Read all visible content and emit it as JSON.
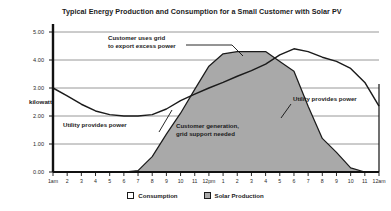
{
  "chart_data": {
    "type": "area",
    "title": "Typical Energy Production and Consumption for a Small Customer with Solar PV",
    "xlabel": "",
    "ylabel": "kilowatt",
    "ylim": [
      0.0,
      5.0
    ],
    "grid": true,
    "legend_position": "bottom",
    "x": [
      "1am",
      "2",
      "3",
      "4",
      "5",
      "6",
      "7",
      "8",
      "9",
      "10",
      "11",
      "12pm",
      "1",
      "2",
      "3",
      "4",
      "5",
      "6",
      "7",
      "8",
      "9",
      "10",
      "11",
      "12am"
    ],
    "yticks": [
      "0.00",
      "1.00",
      "2.00",
      "3.00",
      "4.00",
      "5.00"
    ],
    "ytick_values": [
      0.0,
      1.0,
      2.0,
      3.0,
      4.0,
      5.0
    ],
    "series": [
      {
        "name": "Consumption",
        "color": "#ffffff",
        "line_color": "#1b1b1b",
        "values": [
          3.0,
          2.72,
          2.42,
          2.18,
          2.05,
          2.0,
          2.0,
          2.05,
          2.25,
          2.55,
          2.78,
          3.0,
          3.2,
          3.42,
          3.62,
          3.85,
          4.18,
          4.4,
          4.3,
          4.1,
          3.95,
          3.7,
          3.2,
          2.35
        ]
      },
      {
        "name": "Solar Production",
        "color": "#a9a9a9",
        "line_color": "#1b1b1b",
        "values": [
          0.0,
          0.0,
          0.0,
          0.0,
          0.0,
          0.0,
          0.05,
          0.55,
          1.35,
          2.1,
          2.95,
          3.78,
          4.22,
          4.3,
          4.3,
          4.3,
          3.95,
          3.6,
          2.35,
          1.2,
          0.7,
          0.15,
          0.0,
          0.0
        ]
      }
    ],
    "annotations": [
      {
        "id": "export-excess",
        "lines": [
          "Customer uses grid",
          "to export excess power"
        ]
      },
      {
        "id": "utility-left",
        "lines": [
          "Utility provides power"
        ]
      },
      {
        "id": "customer-generation",
        "lines": [
          "Customer generation,",
          "grid support needed"
        ]
      },
      {
        "id": "utility-right",
        "lines": [
          "Utility provides power"
        ]
      }
    ]
  }
}
